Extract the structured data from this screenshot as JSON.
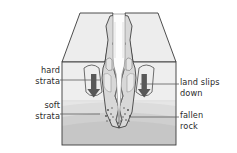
{
  "figure": {
    "type": "geological-block-diagram",
    "canvas": {
      "width": 237,
      "height": 153
    },
    "colors": {
      "outline": "#3a3a3a",
      "top_surface": "#e9e9e9",
      "hard_strata": "#efefef",
      "soft_strata": "#e3e3e3",
      "basal_rock": "#c9c9c9",
      "gorge_wall": "#d6d6d6",
      "gorge_void": "#fdfdfd",
      "arrow": "#555555",
      "leader_line": "#555555",
      "label_text": "#2b2b2b"
    }
  },
  "labels": {
    "hard_strata": "hard\nstrata",
    "soft_strata": "soft\nstrata",
    "land_slips_down": "land slips\ndown",
    "fallen_rock": "fallen\nrock"
  },
  "annotations": {
    "arrows": [
      {
        "name": "left-slip-arrow",
        "direction": "down"
      },
      {
        "name": "right-slip-arrow",
        "direction": "down"
      }
    ],
    "debris": {
      "name": "fallen-rock-debris",
      "description": "scattered rock fragments at gorge floor"
    }
  }
}
